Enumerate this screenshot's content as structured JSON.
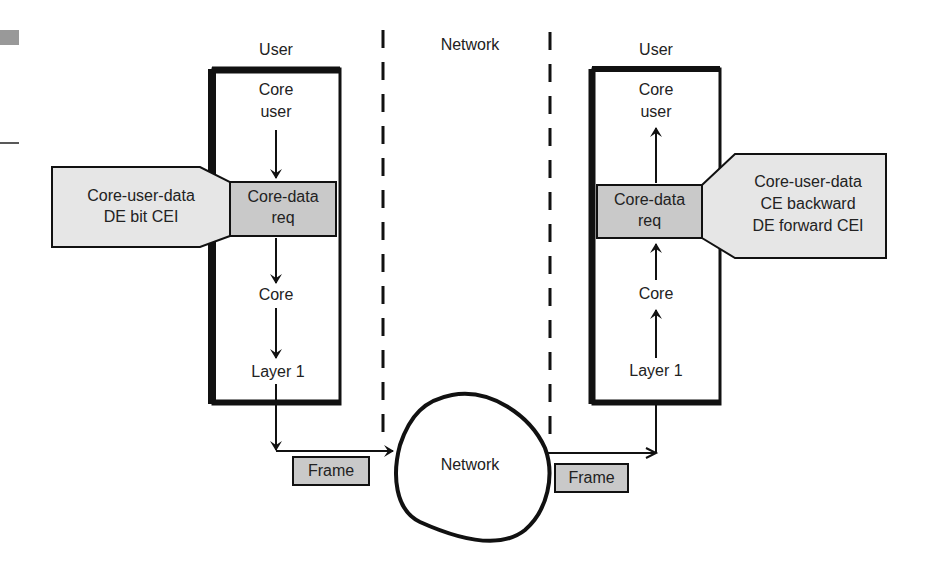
{
  "left_column": {
    "title": "User",
    "core_user_line1": "Core",
    "core_user_line2": "user",
    "req_line1": "Core-data",
    "req_line2": "req",
    "core": "Core",
    "layer1": "Layer 1",
    "callout_line1": "Core-user-data",
    "callout_line2": "DE bit CEI"
  },
  "network_column": {
    "title": "Network",
    "cloud_label": "Network"
  },
  "right_column": {
    "title": "User",
    "core_user_line1": "Core",
    "core_user_line2": "user",
    "req_line1": "Core-data",
    "req_line2": "req",
    "core": "Core",
    "layer1": "Layer 1",
    "callout_line1": "Core-user-data",
    "callout_line2": "CE backward",
    "callout_line3": "DE forward CEI"
  },
  "frames": {
    "left": "Frame",
    "right": "Frame"
  },
  "colors": {
    "box_fill": "#c9c9c9",
    "callout_fill": "#e6e6e6",
    "stroke": "#111111"
  }
}
